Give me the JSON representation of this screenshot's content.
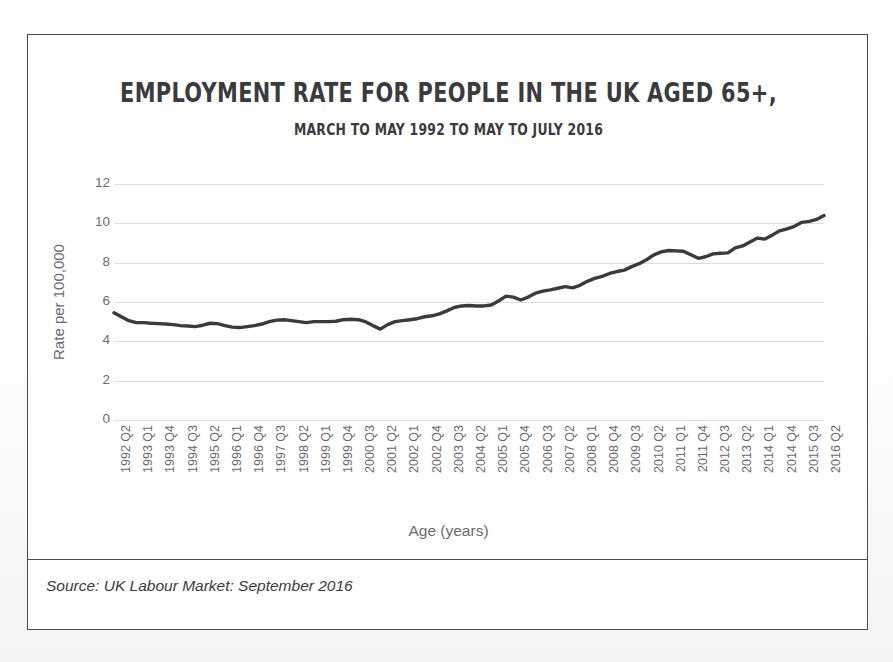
{
  "chart_data": {
    "type": "line",
    "title": "EMPLOYMENT RATE FOR PEOPLE IN THE UK AGED 65+,",
    "subtitle": "MARCH TO MAY 1992 TO MAY TO JULY 2016",
    "xlabel": "Age (years)",
    "ylabel": "Rate per 100,000",
    "source": "Source: UK Labour Market: September 2016",
    "ylim": [
      0,
      12
    ],
    "yticks": [
      0,
      2,
      4,
      6,
      8,
      10,
      12
    ],
    "grid": true,
    "legend": false,
    "line_color": "#3b3b3d",
    "line_width": 3.4,
    "tick_labels": [
      "1992 Q2",
      "1993 Q1",
      "1993 Q4",
      "1994 Q3",
      "1995 Q2",
      "1996 Q1",
      "1996 Q4",
      "1997 Q3",
      "1998 Q2",
      "1999 Q1",
      "1999 Q4",
      "2000 Q3",
      "2001 Q2",
      "2002 Q1",
      "2002 Q4",
      "2003 Q3",
      "2004 Q2",
      "2005 Q1",
      "2005 Q4",
      "2006 Q3",
      "2007 Q2",
      "2008 Q1",
      "2008 Q4",
      "2009 Q3",
      "2010 Q2",
      "2011 Q1",
      "2011 Q4",
      "2012 Q3",
      "2013 Q2",
      "2014 Q1",
      "2014 Q4",
      "2015 Q3",
      "2016 Q2"
    ],
    "tick_step_quarters": 3,
    "x": [
      "1992 Q2",
      "1992 Q3",
      "1992 Q4",
      "1993 Q1",
      "1993 Q2",
      "1993 Q3",
      "1993 Q4",
      "1994 Q1",
      "1994 Q2",
      "1994 Q3",
      "1994 Q4",
      "1995 Q1",
      "1995 Q2",
      "1995 Q3",
      "1995 Q4",
      "1996 Q1",
      "1996 Q2",
      "1996 Q3",
      "1996 Q4",
      "1997 Q1",
      "1997 Q2",
      "1997 Q3",
      "1997 Q4",
      "1998 Q1",
      "1998 Q2",
      "1998 Q3",
      "1998 Q4",
      "1999 Q1",
      "1999 Q2",
      "1999 Q3",
      "1999 Q4",
      "2000 Q1",
      "2000 Q2",
      "2000 Q3",
      "2000 Q4",
      "2001 Q1",
      "2001 Q2",
      "2001 Q3",
      "2001 Q4",
      "2002 Q1",
      "2002 Q2",
      "2002 Q3",
      "2002 Q4",
      "2003 Q1",
      "2003 Q2",
      "2003 Q3",
      "2003 Q4",
      "2004 Q1",
      "2004 Q2",
      "2004 Q3",
      "2004 Q4",
      "2005 Q1",
      "2005 Q2",
      "2005 Q3",
      "2005 Q4",
      "2006 Q1",
      "2006 Q2",
      "2006 Q3",
      "2006 Q4",
      "2007 Q1",
      "2007 Q2",
      "2007 Q3",
      "2007 Q4",
      "2008 Q1",
      "2008 Q2",
      "2008 Q3",
      "2008 Q4",
      "2009 Q1",
      "2009 Q2",
      "2009 Q3",
      "2009 Q4",
      "2010 Q1",
      "2010 Q2",
      "2010 Q3",
      "2010 Q4",
      "2011 Q1",
      "2011 Q2",
      "2011 Q3",
      "2011 Q4",
      "2012 Q1",
      "2012 Q2",
      "2012 Q3",
      "2012 Q4",
      "2013 Q1",
      "2013 Q2",
      "2013 Q3",
      "2013 Q4",
      "2014 Q1",
      "2014 Q2",
      "2014 Q3",
      "2014 Q4",
      "2015 Q1",
      "2015 Q2",
      "2015 Q3",
      "2015 Q4",
      "2016 Q1",
      "2016 Q2"
    ],
    "values": [
      5.45,
      5.25,
      5.05,
      4.95,
      4.95,
      4.92,
      4.9,
      4.88,
      4.85,
      4.8,
      4.78,
      4.75,
      4.82,
      4.92,
      4.9,
      4.8,
      4.72,
      4.7,
      4.75,
      4.8,
      4.88,
      5.0,
      5.08,
      5.1,
      5.05,
      5.0,
      4.95,
      5.0,
      5.0,
      5.0,
      5.02,
      5.1,
      5.12,
      5.1,
      5.0,
      4.8,
      4.62,
      4.85,
      5.0,
      5.05,
      5.1,
      5.15,
      5.25,
      5.3,
      5.4,
      5.55,
      5.72,
      5.8,
      5.82,
      5.8,
      5.8,
      5.85,
      6.05,
      6.3,
      6.25,
      6.1,
      6.25,
      6.45,
      6.55,
      6.62,
      6.7,
      6.78,
      6.72,
      6.85,
      7.05,
      7.2,
      7.3,
      7.45,
      7.55,
      7.62,
      7.8,
      7.95,
      8.15,
      8.4,
      8.55,
      8.62,
      8.6,
      8.58,
      8.4,
      8.22,
      8.3,
      8.45,
      8.48,
      8.5,
      8.75,
      8.85,
      9.05,
      9.25,
      9.2,
      9.4,
      9.62,
      9.72,
      9.85,
      10.05,
      10.1,
      10.2,
      10.4
    ],
    "peak": {
      "label": "2014 Q4",
      "value": 10.8
    },
    "end_value": 10.45,
    "start_value": 5.45
  }
}
